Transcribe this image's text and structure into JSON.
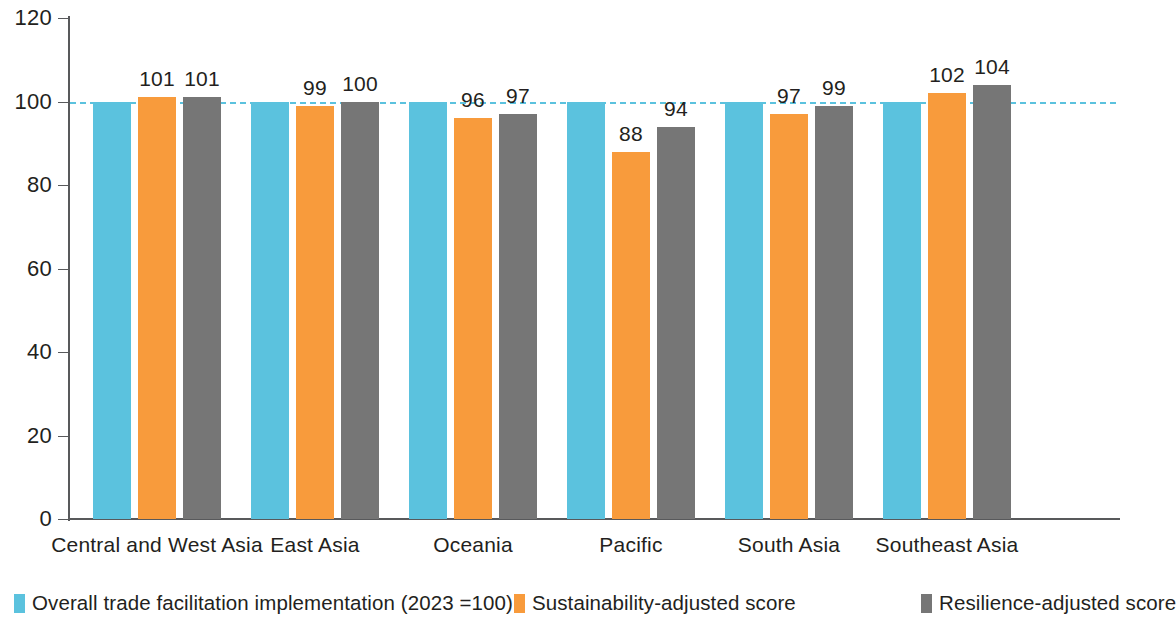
{
  "chart_data": {
    "type": "bar",
    "title": "",
    "subtitle": "",
    "xlabel": "",
    "ylabel": "",
    "ylim": [
      0,
      120
    ],
    "yticks": [
      0,
      20,
      40,
      60,
      80,
      100,
      120
    ],
    "ytick_labels": [
      "0",
      "20",
      "40",
      "60",
      "80",
      "100",
      "120"
    ],
    "grid": false,
    "legend_position": "bottom",
    "reference_line": {
      "value": 100,
      "style": "dashed",
      "color": "#5BC2DE"
    },
    "categories": [
      "Central and West Asia",
      "East Asia",
      "Oceania",
      "Pacific",
      "South Asia",
      "Southeast Asia"
    ],
    "series": [
      {
        "name": "Overall trade facilitation implementation (2023 =100)",
        "color": "#5BC2DE",
        "values": [
          100,
          100,
          100,
          100,
          100,
          100
        ],
        "labels": [
          "",
          "",
          "",
          "",
          "",
          ""
        ]
      },
      {
        "name": "Sustainability-adjusted score",
        "color": "#F89B3C",
        "values": [
          101,
          99,
          96,
          88,
          97,
          102
        ],
        "labels": [
          "101",
          "99",
          "96",
          "88",
          "97",
          "102"
        ]
      },
      {
        "name": "Resilience-adjusted score",
        "color": "#767676",
        "values": [
          101,
          100,
          97,
          94,
          99,
          104
        ],
        "labels": [
          "101",
          "100",
          "97",
          "94",
          "99",
          "104"
        ]
      }
    ]
  },
  "legend": {
    "items": [
      {
        "label": "Overall trade facilitation implementation (2023 =100)",
        "color": "#5BC2DE"
      },
      {
        "label": "Sustainability-adjusted score",
        "color": "#F89B3C"
      },
      {
        "label": "Resilience-adjusted score",
        "color": "#767676"
      }
    ]
  }
}
